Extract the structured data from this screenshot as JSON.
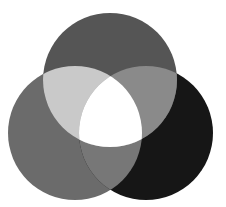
{
  "diagram": {
    "type": "venn-3",
    "caption_fragment": "",
    "circles": [
      {
        "id": "top",
        "cx": 110,
        "cy": 80,
        "r": 67,
        "color": "#555555"
      },
      {
        "id": "left",
        "cx": 75,
        "cy": 133,
        "r": 67,
        "color": "#6b6b6b"
      },
      {
        "id": "right",
        "cx": 146,
        "cy": 133,
        "r": 67,
        "color": "#161616"
      }
    ],
    "overlaps": {
      "top_left": "#c9c9c9",
      "top_right": "#8a8a8a",
      "left_right": "#777777",
      "center": "#ffffff"
    }
  }
}
